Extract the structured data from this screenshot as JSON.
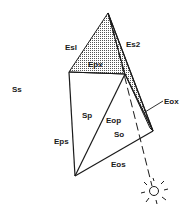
{
  "diagram": {
    "labels": {
      "es1": "Esl",
      "es2": "Es2",
      "epx": "Epx",
      "ss": "Ss",
      "sp": "Sp",
      "eop": "Eop",
      "so": "So",
      "eox": "Eox",
      "eps": "Eps",
      "eos": "Eos"
    },
    "icons": {
      "sun": "sun-icon"
    },
    "colors": {
      "line": "#1a1a1a",
      "shade": "#9a9a9a",
      "background": "#ffffff"
    }
  }
}
